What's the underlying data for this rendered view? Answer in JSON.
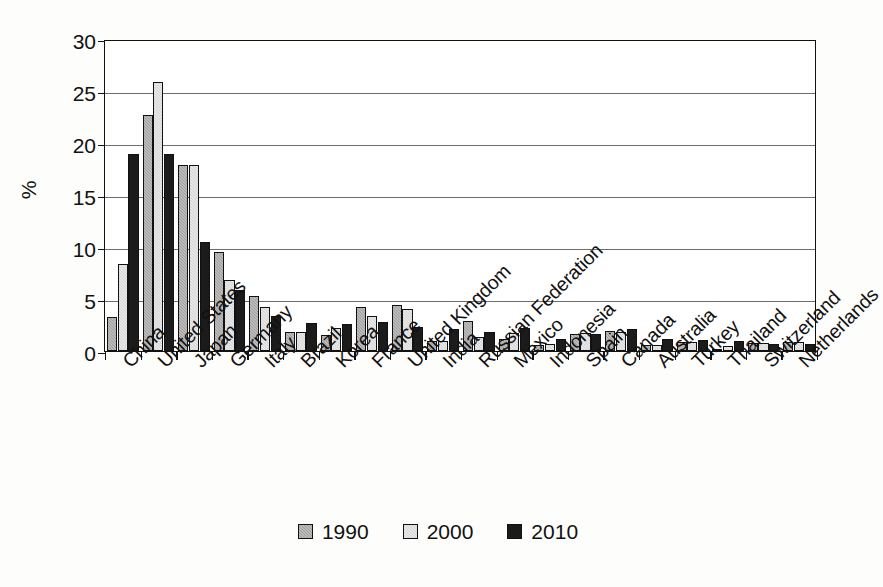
{
  "chart_data": {
    "type": "bar",
    "title": "",
    "subtitle": "",
    "xlabel": "",
    "ylabel": "%",
    "ylim": [
      0,
      30
    ],
    "yticks": [
      0,
      5,
      10,
      15,
      20,
      25,
      30
    ],
    "ytick_labels": [
      "0",
      "5",
      "10",
      "15",
      "20",
      "25",
      "30"
    ],
    "grid": true,
    "legend_position": "bottom-center",
    "categories": [
      "China",
      "United States",
      "Japan",
      "Germany",
      "Italy",
      "Brazil",
      "Korea",
      "France",
      "United Kingdom",
      "India",
      "Russian Federation",
      "Mexico",
      "Indonesia",
      "Spain",
      "Canada",
      "Australia",
      "Turkey",
      "Thailand",
      "Switzerland",
      "Netherlands"
    ],
    "series": [
      {
        "name": "1990",
        "color": "#9e9e9e",
        "values": [
          3.3,
          22.7,
          17.9,
          9.5,
          5.3,
          1.8,
          1.5,
          4.2,
          4.4,
          1.0,
          2.9,
          1.2,
          0.6,
          1.6,
          1.9,
          0.6,
          0.9,
          0.2,
          0.8,
          0.9
        ]
      },
      {
        "name": "2000",
        "color": "#d4d4d4",
        "values": [
          8.4,
          25.9,
          17.9,
          6.8,
          4.2,
          1.8,
          2.2,
          3.4,
          4.0,
          1.0,
          1.3,
          1.7,
          0.7,
          1.7,
          1.8,
          0.6,
          0.9,
          0.5,
          0.8,
          0.9
        ]
      },
      {
        "name": "2010",
        "color": "#1b1b1b",
        "values": [
          18.9,
          18.9,
          10.5,
          5.9,
          3.4,
          2.7,
          2.6,
          2.8,
          2.3,
          2.1,
          1.8,
          2.2,
          1.2,
          1.6,
          2.1,
          1.2,
          1.1,
          1.0,
          0.7,
          0.7
        ]
      }
    ]
  },
  "legend": {
    "items": [
      {
        "label": "1990"
      },
      {
        "label": "2000"
      },
      {
        "label": "2010"
      }
    ]
  }
}
